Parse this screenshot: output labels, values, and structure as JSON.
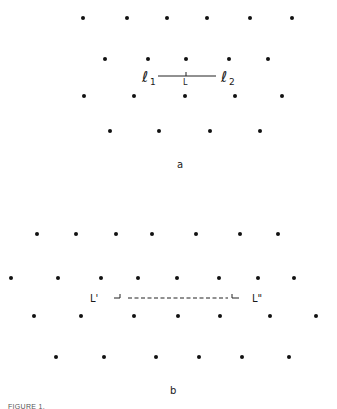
{
  "panel_a": {
    "label": "a",
    "rows": [
      {
        "y": 18,
        "x": [
          83,
          127,
          167,
          207,
          250,
          292
        ]
      },
      {
        "y": 59,
        "x": [
          105,
          148,
          186,
          229,
          268
        ]
      },
      {
        "y": 96,
        "x": [
          84,
          134,
          185,
          235,
          282
        ]
      },
      {
        "y": 131,
        "x": [
          110,
          159,
          210,
          260
        ]
      }
    ],
    "line_left_label": "ℓ",
    "line_left_sub": "1",
    "line_right_label": "ℓ",
    "line_right_sub": "2",
    "midpoint_label": "L"
  },
  "panel_b": {
    "label": "b",
    "rows": [
      {
        "y": 234,
        "x": [
          37,
          76,
          116,
          152,
          196,
          240,
          278
        ]
      },
      {
        "y": 278,
        "x": [
          11,
          58,
          101,
          138,
          177,
          219,
          258,
          294
        ]
      },
      {
        "y": 316,
        "x": [
          34,
          81,
          134,
          178,
          220,
          270,
          316
        ]
      },
      {
        "y": 357,
        "x": [
          56,
          104,
          156,
          199,
          242,
          289
        ]
      }
    ],
    "left_label": "L'",
    "right_label": "L\""
  },
  "caption": "FIGURE 1."
}
